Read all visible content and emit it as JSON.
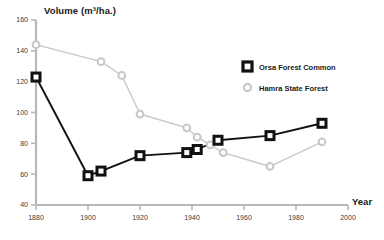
{
  "chart_data": {
    "type": "line",
    "title": "",
    "ylabel": "Volume (m³/ha.)",
    "xlabel": "Year",
    "xlim": [
      1880,
      2000
    ],
    "ylim": [
      40,
      160
    ],
    "xticks": [
      1880,
      1900,
      1920,
      1940,
      1960,
      1980,
      2000
    ],
    "yticks": [
      40,
      60,
      80,
      100,
      120,
      140,
      160
    ],
    "grid": false,
    "legend_position": "upper-right-inside",
    "series": [
      {
        "name": "Orsa Forest Common",
        "marker": "square",
        "color": "#111111",
        "points": [
          {
            "x": 1880,
            "y": 123
          },
          {
            "x": 1900,
            "y": 59
          },
          {
            "x": 1905,
            "y": 62
          },
          {
            "x": 1920,
            "y": 72
          },
          {
            "x": 1938,
            "y": 74
          },
          {
            "x": 1942,
            "y": 76
          },
          {
            "x": 1950,
            "y": 82
          },
          {
            "x": 1970,
            "y": 85
          },
          {
            "x": 1990,
            "y": 93
          }
        ]
      },
      {
        "name": "Hamra State Forest",
        "marker": "circle",
        "color": "#c8c8c8",
        "points": [
          {
            "x": 1880,
            "y": 144
          },
          {
            "x": 1905,
            "y": 133
          },
          {
            "x": 1913,
            "y": 124
          },
          {
            "x": 1920,
            "y": 99
          },
          {
            "x": 1938,
            "y": 90
          },
          {
            "x": 1942,
            "y": 84
          },
          {
            "x": 1947,
            "y": 79
          },
          {
            "x": 1952,
            "y": 74
          },
          {
            "x": 1970,
            "y": 65
          },
          {
            "x": 1990,
            "y": 81
          }
        ]
      }
    ]
  },
  "axes": {
    "ylabel": "Volume (m³/ha.)",
    "xlabel": "Year",
    "ytick_labels": [
      "160",
      "140",
      "120",
      "100",
      "80",
      "60",
      "40"
    ],
    "xtick_labels": [
      "1880",
      "1900",
      "1920",
      "1940",
      "1960",
      "1980",
      "2000"
    ],
    "axis_color": "#b8b8b8"
  },
  "legend": {
    "entries": [
      {
        "label": "Orsa Forest Common",
        "marker": "square",
        "color": "#111111"
      },
      {
        "label": "Hamra State Forest",
        "marker": "circle",
        "color": "#c8c8c8"
      }
    ]
  }
}
